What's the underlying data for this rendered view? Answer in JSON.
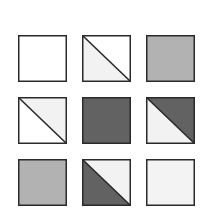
{
  "puzzle": {
    "rows": 3,
    "cols": 3,
    "colors": {
      "white": "#ffffff",
      "light": "#f2f2f2",
      "mid": "#b2b2b2",
      "dark": "#626262",
      "border": "#2a2a2a"
    },
    "cells": [
      {
        "row": 0,
        "col": 0,
        "type": "solid",
        "fill": "#ffffff"
      },
      {
        "row": 0,
        "col": 1,
        "type": "diagonal",
        "upper_right": "#ffffff",
        "lower_left": "#f2f2f2"
      },
      {
        "row": 0,
        "col": 2,
        "type": "solid",
        "fill": "#b2b2b2"
      },
      {
        "row": 1,
        "col": 0,
        "type": "diagonal",
        "upper_right": "#f2f2f2",
        "lower_left": "#ffffff"
      },
      {
        "row": 1,
        "col": 1,
        "type": "solid",
        "fill": "#626262"
      },
      {
        "row": 1,
        "col": 2,
        "type": "diagonal",
        "upper_right": "#626262",
        "lower_left": "#f2f2f2"
      },
      {
        "row": 2,
        "col": 0,
        "type": "solid",
        "fill": "#b2b2b2"
      },
      {
        "row": 2,
        "col": 1,
        "type": "diagonal",
        "upper_right": "#f2f2f2",
        "lower_left": "#626262"
      },
      {
        "row": 2,
        "col": 2,
        "type": "solid",
        "fill": "#f3f3f3"
      }
    ]
  }
}
